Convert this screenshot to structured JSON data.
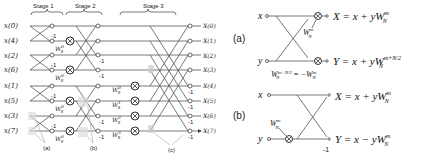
{
  "left_diagram": {
    "stages": [
      "Stage 1",
      "Stage 2",
      "Stage 3"
    ],
    "inputs": [
      "x(0)",
      "x(4)",
      "x(2)",
      "x(6)",
      "x(1)",
      "x(5)",
      "x(3)",
      "x(7)"
    ],
    "outputs": [
      "X(0)",
      "X(1)",
      "X(2)",
      "X(3)",
      "X(4)",
      "X(5)",
      "X(6)",
      "X(7)"
    ],
    "neg_one": "-1",
    "twiddles_stage1": [
      "W",
      "W",
      "W",
      "W"
    ],
    "twiddle_stage1_sup": "0",
    "twiddle_sub": "8",
    "twiddles_stage2_sup": [
      "0",
      "2",
      "0",
      "2"
    ],
    "twiddles_stage3_sup": [
      "0",
      "1",
      "2",
      "3"
    ],
    "callouts": [
      "(a)",
      "(b)",
      "(c)"
    ]
  },
  "right_diagram": {
    "a": {
      "label": "(a)",
      "in_x": "x",
      "in_y": "y",
      "twiddle": "W",
      "twiddle_sup": "m",
      "twiddle_sub": "N",
      "eq_X": "X = x + yW",
      "eq_X_sup": "m",
      "eq_X_sub": "N",
      "eq_Y": "Y = x + yW",
      "eq_Y_sup": "m+N/2",
      "eq_Y_sub": "N",
      "note_lhs": "W",
      "note_lhs_sup": "m+N/2",
      "note_lhs_sub": "N",
      "note_rhs": "= −W",
      "note_rhs_sup": "m",
      "note_rhs_sub": "N"
    },
    "b": {
      "label": "(b)",
      "in_x": "x",
      "in_y": "y",
      "twiddle": "W",
      "twiddle_sup": "m",
      "twiddle_sub": "N",
      "eq_X": "X = x + yW",
      "eq_X_sup": "m",
      "eq_X_sub": "N",
      "eq_Y": "Y = x − yW",
      "eq_Y_sup": "m",
      "eq_Y_sub": "N",
      "neg_one": "-1"
    }
  }
}
